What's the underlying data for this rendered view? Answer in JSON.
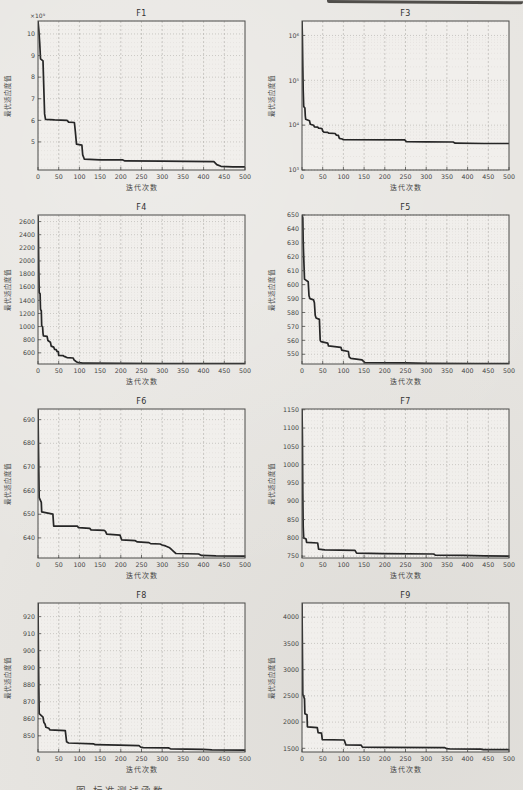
{
  "page": {
    "caption_fragment": "图  标准测试函数"
  },
  "labels": {
    "xlabel": "迭代次数",
    "ylabel": "最优适应度值"
  },
  "colors": {
    "paper": "#e7e5e1",
    "plot_bg": "#f1efec",
    "line": "#262626",
    "grid_major": "#aeaca8",
    "grid_minor": "#d6d3cf",
    "axis": "#4a4a48",
    "text": "#454545",
    "title": "#333333",
    "scan_band": "#35332f"
  },
  "chart_data": [
    {
      "type": "line",
      "title": "F1",
      "xlabel": "迭代次数",
      "ylabel": "最优适应度值",
      "yscale": "linear",
      "y_multiplier": "×10⁹",
      "xlim": [
        0,
        500
      ],
      "xticks": [
        0,
        50,
        100,
        150,
        200,
        250,
        300,
        350,
        400,
        450,
        500
      ],
      "ylim": [
        3.7,
        10.6
      ],
      "yticks": [
        5,
        6,
        7,
        8,
        9,
        10
      ],
      "points": [
        [
          0,
          10.6
        ],
        [
          2,
          10.2
        ],
        [
          4,
          9.6
        ],
        [
          6,
          8.85
        ],
        [
          12,
          8.75
        ],
        [
          14,
          7.5
        ],
        [
          16,
          6.3
        ],
        [
          18,
          6.05
        ],
        [
          40,
          6.02
        ],
        [
          70,
          6.0
        ],
        [
          74,
          5.92
        ],
        [
          88,
          5.9
        ],
        [
          90,
          5.5
        ],
        [
          93,
          4.9
        ],
        [
          106,
          4.85
        ],
        [
          108,
          4.4
        ],
        [
          112,
          4.2
        ],
        [
          150,
          4.17
        ],
        [
          205,
          4.17
        ],
        [
          210,
          4.12
        ],
        [
          300,
          4.11
        ],
        [
          360,
          4.1
        ],
        [
          425,
          4.09
        ],
        [
          432,
          3.95
        ],
        [
          442,
          3.87
        ],
        [
          470,
          3.85
        ],
        [
          500,
          3.85
        ]
      ]
    },
    {
      "type": "line",
      "title": "F3",
      "xlabel": "迭代次数",
      "ylabel": "最优适应度值",
      "yscale": "log",
      "xlim": [
        0,
        500
      ],
      "xticks": [
        0,
        50,
        100,
        150,
        200,
        250,
        300,
        350,
        400,
        450,
        500
      ],
      "ylim": [
        1000,
        2100000
      ],
      "yticks": [
        1000,
        10000,
        100000,
        1000000
      ],
      "ytick_labels": [
        "10³",
        "10⁴",
        "10⁵",
        "10⁶"
      ],
      "points": [
        [
          0,
          2100000
        ],
        [
          1,
          900000
        ],
        [
          2,
          200000
        ],
        [
          3,
          60000
        ],
        [
          4,
          26000
        ],
        [
          7,
          24000
        ],
        [
          8,
          16000
        ],
        [
          9,
          13500
        ],
        [
          18,
          12500
        ],
        [
          20,
          10500
        ],
        [
          28,
          10000
        ],
        [
          30,
          9200
        ],
        [
          38,
          9000
        ],
        [
          40,
          8600
        ],
        [
          48,
          8400
        ],
        [
          50,
          7400
        ],
        [
          53,
          7000
        ],
        [
          62,
          6900
        ],
        [
          65,
          6600
        ],
        [
          80,
          6500
        ],
        [
          83,
          6000
        ],
        [
          88,
          5900
        ],
        [
          90,
          5100
        ],
        [
          97,
          4900
        ],
        [
          100,
          4750
        ],
        [
          248,
          4700
        ],
        [
          252,
          4300
        ],
        [
          300,
          4250
        ],
        [
          365,
          4200
        ],
        [
          370,
          3950
        ],
        [
          440,
          3900
        ],
        [
          500,
          3900
        ]
      ]
    },
    {
      "type": "line",
      "title": "F4",
      "xlabel": "迭代次数",
      "ylabel": "最优适应度值",
      "yscale": "linear",
      "xlim": [
        0,
        500
      ],
      "xticks": [
        0,
        50,
        100,
        150,
        200,
        250,
        300,
        350,
        400,
        450,
        500
      ],
      "ylim": [
        430,
        2700
      ],
      "yticks": [
        600,
        800,
        1000,
        1200,
        1400,
        1600,
        1800,
        2000,
        2200,
        2400,
        2600
      ],
      "points": [
        [
          0,
          2680
        ],
        [
          1,
          2350
        ],
        [
          2,
          1850
        ],
        [
          3,
          1520
        ],
        [
          5,
          1500
        ],
        [
          6,
          1260
        ],
        [
          8,
          1240
        ],
        [
          9,
          1010
        ],
        [
          11,
          1000
        ],
        [
          12,
          900
        ],
        [
          13,
          858
        ],
        [
          22,
          850
        ],
        [
          24,
          788
        ],
        [
          30,
          762
        ],
        [
          32,
          702
        ],
        [
          38,
          688
        ],
        [
          40,
          652
        ],
        [
          44,
          648
        ],
        [
          46,
          622
        ],
        [
          49,
          618
        ],
        [
          50,
          560
        ],
        [
          61,
          556
        ],
        [
          63,
          546
        ],
        [
          67,
          538
        ],
        [
          70,
          528
        ],
        [
          85,
          522
        ],
        [
          87,
          492
        ],
        [
          91,
          472
        ],
        [
          95,
          458
        ],
        [
          99,
          450
        ],
        [
          108,
          444
        ],
        [
          120,
          442
        ],
        [
          200,
          440
        ],
        [
          300,
          438
        ],
        [
          400,
          437
        ],
        [
          500,
          437
        ]
      ]
    },
    {
      "type": "line",
      "title": "F5",
      "xlabel": "迭代次数",
      "ylabel": "最优适应度值",
      "yscale": "linear",
      "xlim": [
        0,
        500
      ],
      "xticks": [
        0,
        50,
        100,
        150,
        200,
        250,
        300,
        350,
        400,
        450,
        500
      ],
      "ylim": [
        543,
        650
      ],
      "yticks": [
        550,
        560,
        570,
        580,
        590,
        600,
        610,
        620,
        630,
        640,
        650
      ],
      "points": [
        [
          0,
          650
        ],
        [
          2,
          648
        ],
        [
          3,
          631
        ],
        [
          4,
          620
        ],
        [
          5,
          612
        ],
        [
          6,
          604
        ],
        [
          15,
          602
        ],
        [
          17,
          592
        ],
        [
          19,
          590
        ],
        [
          28,
          589
        ],
        [
          30,
          587
        ],
        [
          32,
          578
        ],
        [
          34,
          576
        ],
        [
          42,
          575
        ],
        [
          44,
          560
        ],
        [
          46,
          559
        ],
        [
          62,
          558
        ],
        [
          64,
          556
        ],
        [
          94,
          555
        ],
        [
          96,
          553
        ],
        [
          112,
          552
        ],
        [
          114,
          548
        ],
        [
          118,
          547
        ],
        [
          145,
          546
        ],
        [
          148,
          545
        ],
        [
          152,
          544
        ],
        [
          250,
          543.8
        ],
        [
          300,
          543.5
        ],
        [
          420,
          543.3
        ],
        [
          500,
          543.2
        ]
      ]
    },
    {
      "type": "line",
      "title": "F6",
      "xlabel": "迭代次数",
      "ylabel": "最优适应度值",
      "yscale": "linear",
      "xlim": [
        0,
        500
      ],
      "xticks": [
        0,
        50,
        100,
        150,
        200,
        250,
        300,
        350,
        400,
        450,
        500
      ],
      "ylim": [
        631.5,
        694.5
      ],
      "yticks": [
        640,
        650,
        660,
        670,
        680,
        690
      ],
      "points": [
        [
          0,
          694
        ],
        [
          1,
          680
        ],
        [
          2,
          668
        ],
        [
          3,
          657
        ],
        [
          8,
          655
        ],
        [
          9,
          651
        ],
        [
          36,
          650
        ],
        [
          38,
          645
        ],
        [
          95,
          645
        ],
        [
          98,
          644.3
        ],
        [
          125,
          644
        ],
        [
          128,
          643.4
        ],
        [
          160,
          643.2
        ],
        [
          163,
          642.8
        ],
        [
          166,
          641.6
        ],
        [
          198,
          641.2
        ],
        [
          202,
          639.2
        ],
        [
          235,
          638.8
        ],
        [
          240,
          638.3
        ],
        [
          268,
          638
        ],
        [
          272,
          637.6
        ],
        [
          295,
          637.4
        ],
        [
          300,
          637
        ],
        [
          308,
          636.6
        ],
        [
          318,
          635.8
        ],
        [
          323,
          635
        ],
        [
          328,
          634.2
        ],
        [
          333,
          633.4
        ],
        [
          388,
          633.2
        ],
        [
          395,
          632.6
        ],
        [
          430,
          632.4
        ],
        [
          500,
          632.3
        ]
      ]
    },
    {
      "type": "line",
      "title": "F7",
      "xlabel": "迭代次数",
      "ylabel": "最优适应度值",
      "yscale": "linear",
      "xlim": [
        0,
        500
      ],
      "xticks": [
        0,
        50,
        100,
        150,
        200,
        250,
        300,
        350,
        400,
        450,
        500
      ],
      "ylim": [
        745,
        1152
      ],
      "yticks": [
        750,
        800,
        850,
        900,
        950,
        1000,
        1050,
        1100,
        1150
      ],
      "points": [
        [
          0,
          1152
        ],
        [
          1,
          1080
        ],
        [
          2,
          920
        ],
        [
          3,
          830
        ],
        [
          4,
          800
        ],
        [
          10,
          797
        ],
        [
          11,
          788
        ],
        [
          38,
          786
        ],
        [
          40,
          769
        ],
        [
          55,
          767
        ],
        [
          128,
          766
        ],
        [
          132,
          758
        ],
        [
          195,
          757
        ],
        [
          318,
          756
        ],
        [
          322,
          753
        ],
        [
          390,
          752
        ],
        [
          440,
          751
        ],
        [
          500,
          750
        ]
      ]
    },
    {
      "type": "line",
      "title": "F8",
      "xlabel": "迭代次数",
      "ylabel": "最优适应度值",
      "yscale": "linear",
      "xlim": [
        0,
        500
      ],
      "xticks": [
        0,
        50,
        100,
        150,
        200,
        250,
        300,
        350,
        400,
        450,
        500
      ],
      "ylim": [
        840.5,
        928
      ],
      "yticks": [
        850,
        860,
        870,
        880,
        890,
        900,
        910,
        920
      ],
      "points": [
        [
          0,
          928
        ],
        [
          1,
          900
        ],
        [
          2,
          878
        ],
        [
          3,
          863
        ],
        [
          12,
          861
        ],
        [
          14,
          858
        ],
        [
          17,
          857
        ],
        [
          19,
          855
        ],
        [
          26,
          854.5
        ],
        [
          29,
          853.5
        ],
        [
          66,
          853
        ],
        [
          69,
          846.5
        ],
        [
          74,
          845.8
        ],
        [
          134,
          845.3
        ],
        [
          138,
          844.8
        ],
        [
          196,
          844.5
        ],
        [
          244,
          844.2
        ],
        [
          248,
          843.4
        ],
        [
          254,
          843.1
        ],
        [
          315,
          842.9
        ],
        [
          320,
          842.4
        ],
        [
          398,
          842.1
        ],
        [
          420,
          841.8
        ],
        [
          500,
          841.6
        ]
      ]
    },
    {
      "type": "line",
      "title": "F9",
      "xlabel": "迭代次数",
      "ylabel": "最优适应度值",
      "yscale": "linear",
      "xlim": [
        0,
        500
      ],
      "xticks": [
        0,
        50,
        100,
        150,
        200,
        250,
        300,
        350,
        400,
        450,
        500
      ],
      "ylim": [
        1430,
        4270
      ],
      "yticks": [
        1500,
        2000,
        2500,
        3000,
        3500,
        4000
      ],
      "points": [
        [
          0,
          4260
        ],
        [
          1,
          3400
        ],
        [
          2,
          2520
        ],
        [
          4,
          2500
        ],
        [
          5,
          2460
        ],
        [
          6,
          2450
        ],
        [
          7,
          2160
        ],
        [
          12,
          2140
        ],
        [
          13,
          1910
        ],
        [
          37,
          1895
        ],
        [
          39,
          1800
        ],
        [
          47,
          1790
        ],
        [
          49,
          1665
        ],
        [
          102,
          1658
        ],
        [
          106,
          1565
        ],
        [
          143,
          1560
        ],
        [
          146,
          1523
        ],
        [
          195,
          1518
        ],
        [
          345,
          1512
        ],
        [
          350,
          1492
        ],
        [
          358,
          1488
        ],
        [
          432,
          1485
        ],
        [
          438,
          1476
        ],
        [
          460,
          1474
        ],
        [
          500,
          1473
        ]
      ]
    }
  ]
}
